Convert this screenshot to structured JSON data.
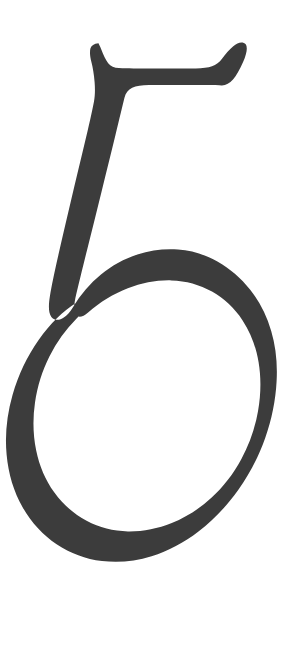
{
  "page": {
    "background_color": "#ffffff",
    "width": 298,
    "height": 664
  },
  "glyph": {
    "character": "5",
    "name": "digit-five",
    "fill_color": "#3c3c3c",
    "description": "Large numeral five",
    "bounds": {
      "x": 28,
      "y": 42,
      "width": 237,
      "height": 566
    },
    "parts": [
      {
        "name": "top-bar",
        "description": "Upper horizontal arm with concave top edge and upward flaring terminals"
      },
      {
        "name": "stem",
        "description": "Descending diagonal stem leaning left from the bar down to the bowl"
      },
      {
        "name": "bowl",
        "description": "Large open oval bowl, open at the upper left with tapered terminal"
      }
    ],
    "path": "M 98.5 43.2 C 94.0 43.6 91.2 45.4 90.4 48.6 C 89.6 51.8 90.0 56.6 91.4 62.0 C 92.9 67.8 94.0 74.6 94.6 82.0 C 95.2 89.6 95.0 96.2 94.0 101.4 C 92.0 111.8 88.8 126.0 84.6 143.6 C 80.4 161.2 75.9 180.0 71.2 199.8 C 66.5 219.6 62.1 238.4 58.2 255.8 C 54.3 273.2 51.5 286.6 50.0 295.6 C 48.8 302.8 48.6 308.4 49.4 312.2 C 50.2 316.0 52.0 318.4 54.8 319.4 C 57.6 320.4 60.6 319.8 63.8 317.6 C 67.0 315.4 70.0 312.0 72.8 307.4 C 80.6 294.6 90.0 283.6 101.0 274.6 C 112.0 265.6 124.2 258.9 137.4 254.6 C 150.6 250.3 164.2 248.6 178.0 249.6 C 191.8 250.6 205.0 254.6 217.4 261.6 C 229.8 268.6 240.8 278.0 250.2 289.8 C 259.6 301.6 266.6 315.4 271.2 331.0 C 275.8 346.6 277.6 363.4 276.6 381.2 C 275.6 400.4 271.8 419.4 265.2 438.0 C 258.6 456.6 249.6 474.0 238.2 490.0 C 226.8 506.0 213.6 519.8 198.8 531.2 C 184.0 542.6 168.2 551.0 151.6 556.2 C 135.0 561.4 118.4 563.0 102.0 561.0 C 85.6 559.0 70.4 553.4 56.6 544.2 C 42.8 535.0 31.4 522.6 22.6 507.2 C 13.8 491.8 8.4 474.2 6.6 454.6 C 4.8 435.0 6.8 415.0 12.6 394.8 C 18.4 374.6 27.2 356.2 38.8 339.8 C 50.4 323.4 63.0 311.0 76.4 302.8 C 79.8 300.7 82.4 300.4 84.0 301.8 C 85.6 303.2 85.6 305.6 84.0 308.8 C 82.4 312.0 79.8 315.4 76.4 318.8 C 65.6 329.6 56.6 342.2 49.4 356.6 C 42.2 371.0 37.4 386.4 35.0 402.6 C 32.6 418.8 33.0 434.8 36.2 450.4 C 39.4 466.0 45.4 480.0 54.2 492.2 C 63.0 504.4 73.8 514.0 86.6 520.8 C 99.4 527.6 113.2 531.2 128.0 531.4 C 142.8 531.6 157.4 528.8 171.8 523.0 C 186.2 517.2 199.4 508.8 211.4 497.8 C 223.4 486.8 233.4 473.8 241.4 459.0 C 249.4 444.2 255.0 428.2 258.0 411.2 C 261.0 394.2 261.2 377.8 258.6 362.2 C 256.0 346.6 250.6 332.6 242.6 320.4 C 234.6 308.2 224.4 298.6 212.0 291.6 C 199.6 284.6 186.0 280.8 171.4 280.4 C 156.8 280.0 142.2 282.6 127.8 288.2 C 113.4 293.8 100.2 301.8 88.4 312.2 C 84.4 315.7 81.0 317.2 78.4 316.6 C 75.8 316.0 74.4 313.6 74.2 309.6 C 74.0 305.6 74.8 300.2 76.4 293.6 C 79.0 282.6 82.6 267.8 87.2 249.4 C 91.8 231.0 96.6 211.6 101.6 191.4 C 106.6 171.2 111.2 152.4 115.4 135.2 C 119.6 118.0 122.6 105.6 124.4 98.0 C 125.6 93.0 128.2 89.6 132.2 87.8 C 136.2 86.0 141.8 85.1 149.0 85.0 C 164.0 84.9 178.4 84.9 192.2 85.0 C 206.0 85.1 215.8 85.2 221.6 85.4 C 225.8 85.5 229.6 83.6 233.0 79.6 C 236.4 75.6 239.8 69.6 243.2 61.8 C 245.6 56.2 246.8 51.8 246.8 48.4 C 246.8 45.0 245.4 43.1 242.6 42.6 C 239.8 42.1 236.6 43.4 233.0 46.4 C 229.4 49.4 225.8 53.4 222.2 58.4 C 219.4 62.2 216.0 64.8 212.0 66.2 C 208.0 67.6 202.6 68.3 195.8 68.4 C 181.4 68.6 167.0 68.6 152.6 68.6 C 138.2 68.6 127.0 68.4 119.0 68.0 C 114.2 67.8 110.6 66.2 108.2 63.2 C 105.8 60.2 103.4 55.4 101.0 48.8 C 100.2 46.6 99.4 45.2 98.5 43.2 Z"
  }
}
